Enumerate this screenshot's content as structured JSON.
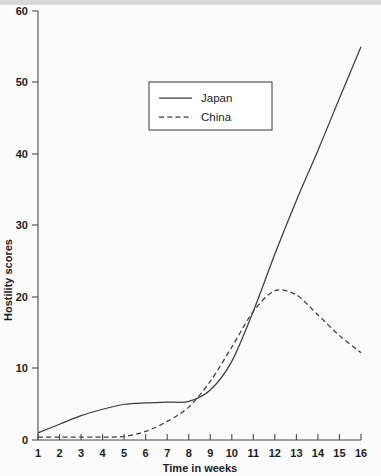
{
  "chart_data": {
    "type": "line",
    "title": "",
    "xlabel": "Time in weeks",
    "ylabel": "Hostility scores",
    "xlim": [
      1,
      16
    ],
    "ylim": [
      0,
      60
    ],
    "grid": false,
    "legend_position": "top-center",
    "x": [
      1,
      2,
      3,
      4,
      5,
      6,
      7,
      8,
      9,
      10,
      11,
      12,
      13,
      14,
      15,
      16
    ],
    "xticks": [
      "1",
      "2",
      "3",
      "4",
      "5",
      "6",
      "7",
      "8",
      "9",
      "10",
      "11",
      "12",
      "13",
      "14",
      "15",
      "16"
    ],
    "yticks": [
      "0",
      "10",
      "20",
      "30",
      "40",
      "50",
      "60"
    ],
    "ytick_values": [
      0,
      10,
      20,
      30,
      40,
      50,
      60
    ],
    "series": [
      {
        "name": "Japan",
        "style": "solid",
        "color": "#3d3d3d",
        "values": [
          1.0,
          2.2,
          3.4,
          4.3,
          5.0,
          5.2,
          5.3,
          5.4,
          7.0,
          11.0,
          18.0,
          26.0,
          33.5,
          40.5,
          47.8,
          55.0
        ]
      },
      {
        "name": "China",
        "style": "dashed",
        "color": "#3d3d3d",
        "values": [
          0.4,
          0.4,
          0.4,
          0.4,
          0.5,
          1.2,
          2.6,
          4.6,
          8.2,
          13.0,
          18.0,
          20.9,
          20.3,
          17.5,
          14.6,
          12.2
        ]
      }
    ]
  },
  "legend": {
    "items": [
      {
        "label": "Japan",
        "style": "solid"
      },
      {
        "label": "China",
        "style": "dashed"
      }
    ]
  }
}
